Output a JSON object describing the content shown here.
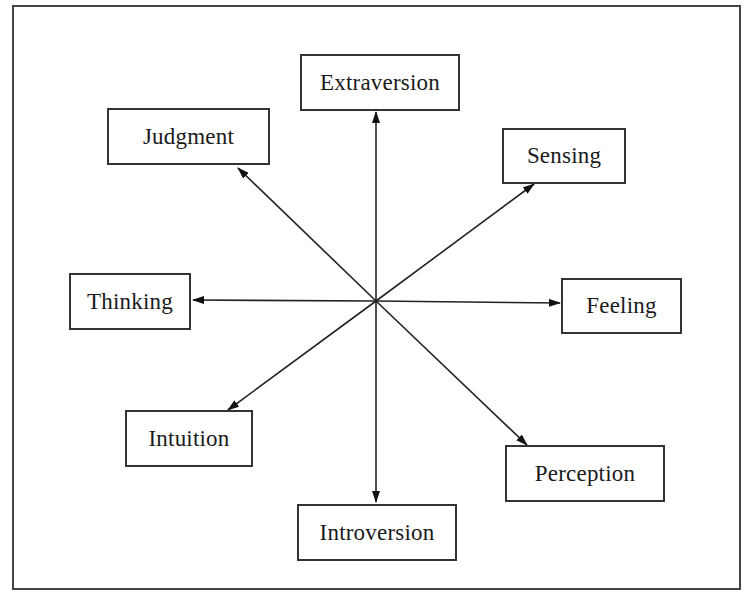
{
  "diagram": {
    "type": "radial-arrows",
    "center": {
      "x": 376,
      "y": 301
    },
    "line_color": "#222222",
    "nodes": [
      {
        "id": "extraversion",
        "label": "Extraversion",
        "box": [
          300,
          54,
          160,
          57
        ],
        "tip": [
          376,
          112
        ]
      },
      {
        "id": "judgment",
        "label": "Judgment",
        "box": [
          107,
          108,
          163,
          57
        ],
        "tip": [
          238,
          168
        ]
      },
      {
        "id": "sensing",
        "label": "Sensing",
        "box": [
          502,
          128,
          124,
          56
        ],
        "tip": [
          534,
          184
        ]
      },
      {
        "id": "thinking",
        "label": "Thinking",
        "box": [
          69,
          273,
          122,
          57
        ],
        "tip": [
          193,
          300
        ]
      },
      {
        "id": "feeling",
        "label": "Feeling",
        "box": [
          561,
          278,
          121,
          56
        ],
        "tip": [
          560,
          303
        ]
      },
      {
        "id": "intuition",
        "label": "Intuition",
        "box": [
          125,
          410,
          128,
          57
        ],
        "tip": [
          228,
          410
        ]
      },
      {
        "id": "perception",
        "label": "Perception",
        "box": [
          505,
          445,
          160,
          57
        ],
        "tip": [
          527,
          445
        ]
      },
      {
        "id": "introversion",
        "label": "Introversion",
        "box": [
          297,
          504,
          160,
          57
        ],
        "tip": [
          376,
          502
        ]
      }
    ],
    "axes": [
      {
        "from": "extraversion",
        "to": "introversion"
      },
      {
        "from": "judgment",
        "to": "perception"
      },
      {
        "from": "sensing",
        "to": "intuition"
      },
      {
        "from": "thinking",
        "to": "feeling"
      }
    ]
  }
}
